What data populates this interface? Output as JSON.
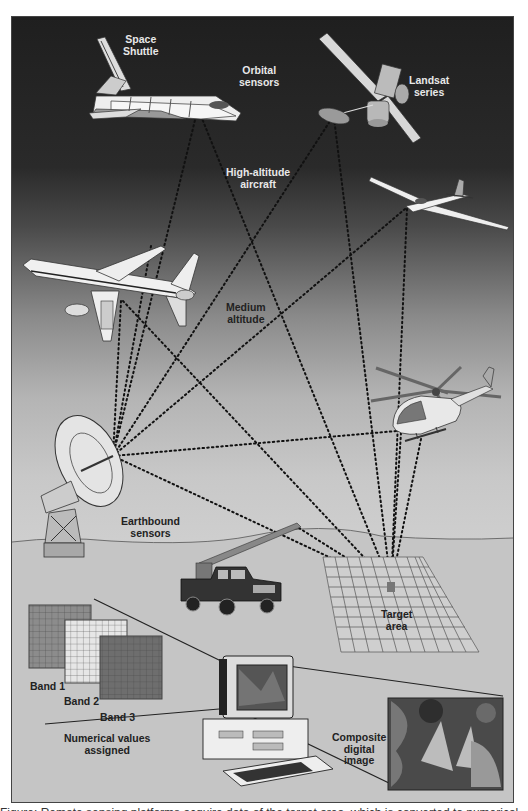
{
  "figure": {
    "labels": {
      "space_shuttle": [
        "Space",
        "Shuttle"
      ],
      "orbital_sensors": [
        "Orbital",
        "sensors"
      ],
      "landsat": [
        "Landsat",
        "series"
      ],
      "high_altitude": [
        "High-altitude",
        "aircraft"
      ],
      "medium_altitude": [
        "Medium",
        "altitude"
      ],
      "earthbound": [
        "Earthbound",
        "sensors"
      ],
      "target_area": [
        "Target",
        "area"
      ],
      "band1": "Band 1",
      "band2": "Band 2",
      "band3": "Band 3",
      "numerical_values": [
        "Numerical values",
        "assigned"
      ],
      "composite_image": [
        "Composite",
        "digital",
        "image"
      ]
    },
    "platforms": [
      "Space Shuttle",
      "Landsat satellite",
      "Glider (high-altitude aircraft)",
      "Airliner (medium altitude)",
      "Helicopter",
      "Radio dish antenna",
      "Pickup truck with boom sensor"
    ],
    "colors": {
      "sky_top": "#1f1f1f",
      "sky_bottom": "#c8c8c8",
      "ground": "#c4c4c4",
      "dotted_lines": "#111111",
      "band1": "#8c8c8c",
      "band2": "#e6e6e6",
      "band3": "#6e6e6e"
    }
  },
  "caption": {
    "text": "Figure: Remote sensing platforms acquire data of the target area, which is converted to numerical values and a composite digital image."
  }
}
